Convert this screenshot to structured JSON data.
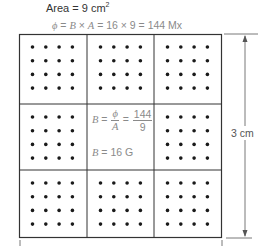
{
  "header": {
    "area_text": "Area = 9 cm",
    "area_exp": "2",
    "flux_phi": "ϕ",
    "flux_mid": " = ",
    "flux_B": "B",
    "flux_times": " × ",
    "flux_A": "A",
    "flux_rest": " = 16 × 9 = 144 Mx"
  },
  "center": {
    "B": "B",
    "eq1": " = ",
    "phi": "ϕ",
    "A": "A",
    "eq2": " = ",
    "num": "144",
    "den": "9",
    "result_B": "B",
    "result_rest": " = 16 G"
  },
  "dimension": {
    "label": "3 cm"
  },
  "grid": {
    "rows": 3,
    "cols": 3,
    "dots_per_side": 4,
    "center_cell_empty": true
  },
  "colors": {
    "line": "#333333",
    "dot": "#1a1a1a",
    "annotation": "#8a8a8a"
  }
}
